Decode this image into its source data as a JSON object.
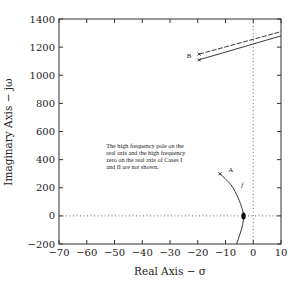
{
  "chart_data": {
    "type": "line",
    "title": "",
    "xlabel": "Real Axis − σ",
    "ylabel": "Imaginary Axis − jω",
    "xlim": [
      -70,
      10
    ],
    "ylim": [
      -200,
      1400
    ],
    "xticks": [
      -70,
      -60,
      -50,
      -40,
      -30,
      -20,
      -10,
      0,
      10
    ],
    "yticks": [
      -200,
      0,
      200,
      400,
      600,
      800,
      1000,
      1200,
      1400
    ],
    "xtick_labels": [
      "−70",
      "−60",
      "−50",
      "−40",
      "−30",
      "−20",
      "−10",
      "0",
      "10"
    ],
    "ytick_labels": [
      "−200",
      "0",
      "200",
      "400",
      "600",
      "800",
      "1000",
      "1200",
      "1400"
    ],
    "grid": false,
    "reference_lines": [
      {
        "orientation": "horizontal",
        "value": 0,
        "style": "dotted"
      },
      {
        "orientation": "vertical",
        "value": 0,
        "style": "dotted"
      }
    ],
    "series": [
      {
        "name": "A",
        "points": [
          [
            -12,
            300
          ],
          [
            -8,
            220
          ],
          [
            -5.5,
            130
          ],
          [
            -4,
            50
          ],
          [
            -3.5,
            0
          ],
          [
            -3.8,
            -60
          ],
          [
            -4.8,
            -130
          ],
          [
            -6,
            -200
          ]
        ],
        "marker_start": "x",
        "highlight_point": [
          -3.5,
          0
        ]
      },
      {
        "name": "B (upper)",
        "points": [
          [
            -19.5,
            1150
          ],
          [
            10,
            1310
          ]
        ],
        "marker_start": "x",
        "style": "dashed"
      },
      {
        "name": "B (lower)",
        "points": [
          [
            -19.5,
            1110
          ],
          [
            10,
            1280
          ]
        ],
        "marker_start": "x",
        "style": "solid"
      }
    ],
    "annotations": [
      {
        "text": "A",
        "x": -9,
        "y": 310
      },
      {
        "text": "B",
        "x": -24,
        "y": 1120
      },
      {
        "text": "f",
        "x": -4.3,
        "y": 205
      },
      {
        "text": "The high frequency pole on the real axis and the high frequency zero on the real axis of Cases I and II are not shown.",
        "lines": [
          "The high frequency pole on the",
          "real axis and the high frequency",
          "zero on the real axis of Cases I",
          "and II are not shown."
        ],
        "x": -53,
        "y": 480
      }
    ]
  }
}
